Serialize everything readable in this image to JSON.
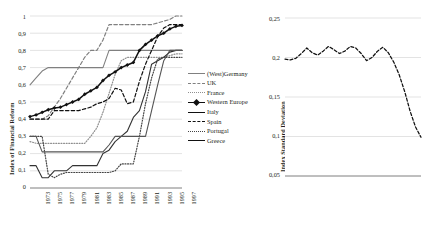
{
  "figure": {
    "panels": [
      "financial-reform-index",
      "index-standard-deviation"
    ]
  },
  "chart_data": [
    {
      "type": "line",
      "id": "financial-reform-index",
      "title": "",
      "xlabel": "",
      "ylabel": "Index of Financial Reform",
      "xlim": [
        1973,
        1998
      ],
      "ylim": [
        0,
        1
      ],
      "grid": true,
      "legend_position": "right",
      "x": [
        1973,
        1974,
        1975,
        1976,
        1977,
        1978,
        1979,
        1980,
        1981,
        1982,
        1983,
        1984,
        1985,
        1986,
        1987,
        1988,
        1989,
        1990,
        1991,
        1992,
        1993,
        1994,
        1995,
        1996,
        1997,
        1998
      ],
      "xticks": [
        "1973",
        "1975",
        "1977",
        "1979",
        "1981",
        "1983",
        "1985",
        "1987",
        "1989",
        "1991",
        "1993",
        "1995",
        "1997"
      ],
      "yticks": [
        "0",
        "0,1",
        "0,2",
        "0,3",
        "0,4",
        "0,5",
        "0,6",
        "0,7",
        "0,8",
        "0,9",
        "1"
      ],
      "series": [
        {
          "name": "(West)Germany",
          "style": "solid",
          "color": "#808080",
          "values": [
            0.6,
            0.64,
            0.68,
            0.7,
            0.7,
            0.7,
            0.7,
            0.7,
            0.7,
            0.7,
            0.7,
            0.7,
            0.7,
            0.8,
            0.8,
            0.8,
            0.8,
            0.8,
            0.8,
            0.8,
            0.8,
            0.8,
            0.8,
            0.8,
            0.8,
            0.8
          ]
        },
        {
          "name": "UK",
          "style": "dashed",
          "color": "#808080",
          "values": [
            0.4,
            0.4,
            0.4,
            0.42,
            0.47,
            0.52,
            0.58,
            0.64,
            0.7,
            0.76,
            0.8,
            0.8,
            0.86,
            0.95,
            0.95,
            0.95,
            0.95,
            0.95,
            0.95,
            0.95,
            0.95,
            0.96,
            0.97,
            0.98,
            1.0,
            1.0
          ]
        },
        {
          "name": "France",
          "style": "dotted",
          "color": "#8f8f8f",
          "values": [
            0.27,
            0.26,
            0.26,
            0.26,
            0.26,
            0.26,
            0.26,
            0.26,
            0.26,
            0.26,
            0.3,
            0.35,
            0.44,
            0.55,
            0.66,
            0.74,
            0.76,
            0.76,
            0.76,
            0.76,
            0.76,
            0.76,
            0.76,
            0.77,
            0.78,
            0.78
          ]
        },
        {
          "name": "Western Europe",
          "style": "solid-marker",
          "color": "#111111",
          "values": [
            0.415,
            0.425,
            0.44,
            0.455,
            0.465,
            0.47,
            0.485,
            0.5,
            0.515,
            0.545,
            0.565,
            0.585,
            0.625,
            0.655,
            0.675,
            0.7,
            0.715,
            0.73,
            0.8,
            0.835,
            0.86,
            0.885,
            0.9,
            0.925,
            0.94,
            0.945
          ]
        },
        {
          "name": "Italy",
          "style": "solid",
          "color": "#333333",
          "values": [
            0.13,
            0.13,
            0.06,
            0.06,
            0.1,
            0.1,
            0.1,
            0.13,
            0.13,
            0.13,
            0.13,
            0.13,
            0.2,
            0.22,
            0.27,
            0.3,
            0.33,
            0.41,
            0.45,
            0.56,
            0.72,
            0.74,
            0.76,
            0.79,
            0.8,
            0.8
          ]
        },
        {
          "name": "Spain",
          "style": "dashed",
          "color": "#111111",
          "values": [
            0.4,
            0.4,
            0.4,
            0.4,
            0.45,
            0.45,
            0.45,
            0.45,
            0.45,
            0.46,
            0.47,
            0.49,
            0.5,
            0.52,
            0.58,
            0.57,
            0.49,
            0.5,
            0.62,
            0.72,
            0.8,
            0.88,
            0.93,
            0.95,
            0.95,
            0.95
          ]
        },
        {
          "name": "Portugal",
          "style": "dotted",
          "color": "#444444",
          "values": [
            0.3,
            0.3,
            0.3,
            0.08,
            0.06,
            0.08,
            0.09,
            0.09,
            0.09,
            0.09,
            0.09,
            0.09,
            0.09,
            0.09,
            0.1,
            0.14,
            0.14,
            0.14,
            0.3,
            0.49,
            0.64,
            0.75,
            0.76,
            0.76,
            0.76,
            0.76
          ]
        },
        {
          "name": "Greece",
          "style": "solid",
          "color": "#555555",
          "values": [
            0.3,
            0.3,
            0.21,
            0.21,
            0.21,
            0.21,
            0.21,
            0.21,
            0.21,
            0.21,
            0.21,
            0.21,
            0.21,
            0.25,
            0.3,
            0.3,
            0.3,
            0.3,
            0.3,
            0.3,
            0.45,
            0.6,
            0.74,
            0.8,
            0.8,
            0.8
          ]
        }
      ]
    },
    {
      "type": "line",
      "id": "index-standard-deviation",
      "title": "",
      "xlabel": "",
      "ylabel": "Index Standard Deviation",
      "xlim": [
        1973,
        1998
      ],
      "ylim": [
        0.05,
        0.25
      ],
      "grid": true,
      "yticks": [
        "0,05",
        "0,1",
        "0,15",
        "0,2",
        "0,25"
      ],
      "xticks": [
        "1973",
        "1975",
        "1977",
        "1979",
        "1981",
        "1983",
        "1985",
        "1987",
        "1989",
        "1991",
        "1993",
        "1995",
        "1997"
      ],
      "series": [
        {
          "name": "Index Standard Deviation",
          "style": "dashed",
          "color": "#111111",
          "x": [
            1973,
            1974,
            1975,
            1976,
            1977,
            1978,
            1979,
            1980,
            1981,
            1982,
            1983,
            1984,
            1985,
            1986,
            1987,
            1988,
            1989,
            1990,
            1991,
            1992,
            1993,
            1994,
            1995,
            1996,
            1997,
            1998
          ],
          "values": [
            0.198,
            0.197,
            0.199,
            0.205,
            0.212,
            0.206,
            0.203,
            0.208,
            0.214,
            0.21,
            0.205,
            0.208,
            0.214,
            0.212,
            0.205,
            0.196,
            0.2,
            0.208,
            0.213,
            0.206,
            0.194,
            0.178,
            0.157,
            0.132,
            0.112,
            0.099
          ]
        }
      ]
    }
  ],
  "legend": {
    "items": [
      {
        "label": "(West)Germany",
        "key": "solid-gray"
      },
      {
        "label": "UK",
        "key": "dash-gray"
      },
      {
        "label": "France",
        "key": "dot-gray"
      },
      {
        "label": "Western Europe",
        "key": "solid-black-marker"
      },
      {
        "label": "Italy",
        "key": "solid-black"
      },
      {
        "label": "Spain",
        "key": "dash-black"
      },
      {
        "label": "Portugal",
        "key": "dot-black"
      },
      {
        "label": "Greece",
        "key": "solid-black"
      }
    ]
  }
}
